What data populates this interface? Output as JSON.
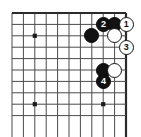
{
  "figure": {
    "board": {
      "columns": 11,
      "rows": 10,
      "line_color": "#4a4a4a",
      "edge_color": "#2b2b2b",
      "background_color": "#ffffff",
      "origin_x": 12,
      "origin_y": 13,
      "spacing": 11.4,
      "top_edge_is_border": true,
      "right_edge_is_border": true,
      "star_points": [
        {
          "name": "star-point-upper-left",
          "col": 2,
          "row": 2
        },
        {
          "name": "star-point-lower-left",
          "col": 2,
          "row": 8
        },
        {
          "name": "star-point-lower-right",
          "col": 8,
          "row": 8
        }
      ]
    },
    "stones": [
      {
        "id": "black-move-2",
        "color": "black",
        "label": "2",
        "col": 8,
        "row": 1,
        "diameter": 15
      },
      {
        "id": "black-stone-a",
        "color": "black",
        "label": "",
        "col": 9,
        "row": 1,
        "diameter": 15
      },
      {
        "id": "white-move-1",
        "color": "white",
        "label": "1",
        "col": 10,
        "row": 1,
        "diameter": 15
      },
      {
        "id": "black-stone-b",
        "color": "black",
        "label": "",
        "col": 7,
        "row": 2,
        "diameter": 15
      },
      {
        "id": "white-stone-c",
        "color": "white",
        "label": "",
        "col": 9,
        "row": 2,
        "diameter": 15
      },
      {
        "id": "white-move-3",
        "color": "white",
        "label": "3",
        "col": 10,
        "row": 3,
        "diameter": 15
      },
      {
        "id": "black-stone-d",
        "color": "black",
        "label": "",
        "col": 8,
        "row": 5,
        "diameter": 15
      },
      {
        "id": "white-stone-e",
        "color": "white",
        "label": "",
        "col": 9,
        "row": 5,
        "diameter": 15
      },
      {
        "id": "black-move-4",
        "color": "black",
        "label": "4",
        "col": 8,
        "row": 6,
        "diameter": 15
      }
    ],
    "colors": {
      "black_stone": "#121212",
      "white_stone": "#ffffff",
      "stone_outline": "#151515",
      "grid": "#4a4a4a"
    }
  }
}
